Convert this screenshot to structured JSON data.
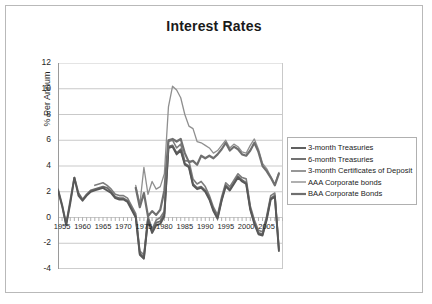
{
  "chart_data": {
    "type": "line",
    "title": "Interest Rates",
    "xlabel": "Year",
    "ylabel": "% Per Annum",
    "xlim": [
      1954,
      2009
    ],
    "ylim": [
      -4,
      12
    ],
    "ytick_step": 2,
    "yticks": [
      "-4",
      "-2",
      "0",
      "2",
      "4",
      "6",
      "8",
      "10",
      "12"
    ],
    "xticks": [
      "1955",
      "1960",
      "1965",
      "1970",
      "1975",
      "1980",
      "1985",
      "1990",
      "1995",
      "2000",
      "2005"
    ],
    "grid": "horizontal",
    "legend_position": "right",
    "x": [
      1954,
      1955,
      1956,
      1957,
      1958,
      1959,
      1960,
      1961,
      1962,
      1963,
      1964,
      1965,
      1966,
      1967,
      1968,
      1969,
      1970,
      1971,
      1972,
      1973,
      1974,
      1975,
      1976,
      1977,
      1978,
      1979,
      1980,
      1981,
      1982,
      1983,
      1984,
      1985,
      1986,
      1987,
      1988,
      1989,
      1990,
      1991,
      1992,
      1993,
      1994,
      1995,
      1996,
      1997,
      1998,
      1999,
      2000,
      2001,
      2002,
      2003,
      2004,
      2005,
      2006,
      2007,
      2008
    ],
    "series": [
      {
        "name": "3-month Treasuries",
        "color": "#585858",
        "width": 1.9,
        "values": [
          2.1,
          0.9,
          -0.6,
          1.1,
          3.1,
          1.7,
          1.3,
          1.7,
          2.0,
          2.1,
          2.2,
          2.3,
          2.1,
          1.9,
          1.5,
          1.4,
          1.4,
          1.2,
          0.6,
          0.0,
          -2.9,
          -3.2,
          -0.2,
          -1.2,
          -0.6,
          -0.5,
          0.1,
          5.4,
          5.5,
          4.9,
          5.2,
          4.1,
          3.9,
          2.5,
          2.2,
          2.3,
          2.0,
          1.4,
          0.5,
          -0.1,
          1.3,
          2.4,
          2.1,
          2.6,
          3.1,
          2.8,
          2.6,
          0.6,
          -0.5,
          -1.3,
          -1.4,
          -0.2,
          1.4,
          1.6,
          -2.6
        ]
      },
      {
        "name": "6-month Treasuries",
        "color": "#6b6b6b",
        "width": 1.9,
        "values": [
          2.2,
          1.0,
          -0.5,
          1.3,
          3.1,
          1.9,
          1.4,
          1.8,
          2.1,
          2.2,
          2.3,
          2.4,
          2.3,
          2.0,
          1.6,
          1.5,
          1.5,
          1.3,
          0.7,
          0.1,
          -2.8,
          -3.1,
          -0.1,
          -1.1,
          -0.4,
          -0.3,
          0.3,
          5.5,
          5.6,
          5.0,
          5.3,
          4.2,
          4.0,
          2.6,
          2.3,
          2.4,
          2.1,
          1.5,
          0.6,
          0.0,
          1.4,
          2.5,
          2.2,
          2.7,
          3.2,
          2.9,
          2.7,
          0.7,
          -0.4,
          -1.2,
          -1.3,
          -0.1,
          1.5,
          1.7,
          -2.5
        ]
      },
      {
        "name": "3-month Certificates of Deposit",
        "color": "#7d7d7d",
        "width": 1.6,
        "values": [
          null,
          null,
          null,
          null,
          null,
          null,
          null,
          null,
          null,
          2.5,
          2.6,
          2.7,
          2.5,
          2.2,
          1.8,
          1.7,
          1.7,
          1.5,
          0.9,
          0.3,
          -2.6,
          -2.9,
          0.1,
          -0.9,
          -0.2,
          0.0,
          0.5,
          5.9,
          6.0,
          5.4,
          5.7,
          4.4,
          4.4,
          3.0,
          2.6,
          2.8,
          2.4,
          1.7,
          0.8,
          0.2,
          1.6,
          2.7,
          2.4,
          2.9,
          3.4,
          3.1,
          3.0,
          0.9,
          -0.2,
          -1.0,
          -1.1,
          0.1,
          1.7,
          1.9,
          -2.4
        ]
      },
      {
        "name": "AAA Corporate bonds",
        "color": "#8f8f8f",
        "width": 1.3,
        "values": [
          null,
          null,
          null,
          null,
          null,
          null,
          null,
          null,
          null,
          null,
          null,
          null,
          null,
          null,
          null,
          null,
          null,
          null,
          null,
          2.5,
          1.0,
          3.9,
          1.8,
          2.8,
          2.2,
          2.4,
          3.4,
          8.6,
          10.2,
          9.9,
          9.3,
          8.0,
          7.1,
          6.9,
          5.9,
          5.8,
          5.6,
          5.4,
          5.0,
          5.2,
          5.6,
          6.0,
          5.4,
          5.7,
          5.5,
          5.1,
          5.0,
          5.6,
          6.1,
          5.3,
          4.2,
          3.8,
          3.2,
          2.6,
          3.5
        ]
      },
      {
        "name": "BAA Corporate Bonds",
        "color": "#6f6f6f",
        "width": 2.2,
        "values": [
          null,
          null,
          null,
          null,
          null,
          null,
          null,
          null,
          null,
          null,
          null,
          null,
          null,
          null,
          null,
          null,
          null,
          null,
          null,
          2.3,
          0.8,
          1.9,
          0.1,
          0.5,
          0.2,
          0.6,
          2.1,
          6.0,
          6.1,
          5.9,
          6.1,
          5.0,
          4.3,
          4.4,
          4.1,
          4.8,
          4.6,
          4.8,
          4.6,
          4.9,
          5.3,
          5.8,
          5.2,
          5.5,
          5.3,
          4.9,
          4.8,
          5.2,
          5.8,
          5.1,
          4.0,
          3.6,
          3.1,
          2.5,
          3.4
        ]
      }
    ]
  },
  "chart": {
    "title": "Interest Rates",
    "x_axis_title": "Year",
    "y_axis_title": "% Per Annum"
  },
  "legend": {
    "items": [
      {
        "label": "3-month Treasuries"
      },
      {
        "label": "6-month Treasuries"
      },
      {
        "label": "3-month Certificates of Deposit"
      },
      {
        "label": "AAA Corporate bonds"
      },
      {
        "label": "BAA Corporate Bonds"
      }
    ]
  }
}
